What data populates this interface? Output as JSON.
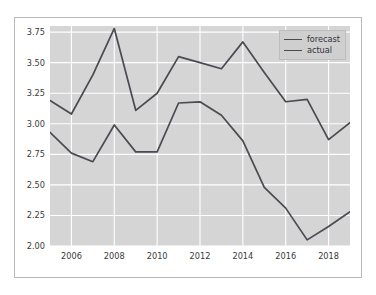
{
  "chart_data": {
    "type": "line",
    "title": "",
    "xlabel": "",
    "ylabel": "",
    "x": [
      2005,
      2006,
      2007,
      2008,
      2009,
      2010,
      2011,
      2012,
      2013,
      2014,
      2015,
      2016,
      2017,
      2018,
      2019
    ],
    "xlim": [
      2005,
      2019
    ],
    "ylim": [
      2.0,
      3.8
    ],
    "grid": true,
    "legend_position": "upper right",
    "xticks": [
      2006,
      2008,
      2010,
      2012,
      2014,
      2016,
      2018
    ],
    "xtick_labels": [
      "2006",
      "2008",
      "2010",
      "2012",
      "2014",
      "2016",
      "2018"
    ],
    "yticks": [
      2.0,
      2.25,
      2.5,
      2.75,
      3.0,
      3.25,
      3.5,
      3.75
    ],
    "ytick_labels": [
      "2.00",
      "2.25",
      "2.50",
      "2.75",
      "3.00",
      "3.25",
      "3.50",
      "3.75"
    ],
    "series": [
      {
        "name": "forecast",
        "color": "#4a4a52",
        "values": [
          3.19,
          3.08,
          3.4,
          3.78,
          3.11,
          3.25,
          3.55,
          3.5,
          3.45,
          3.67,
          3.42,
          3.18,
          3.2,
          2.87,
          3.01
        ]
      },
      {
        "name": "actual",
        "color": "#4a4a52",
        "values": [
          2.93,
          2.76,
          2.69,
          2.99,
          2.77,
          2.77,
          3.17,
          3.18,
          3.07,
          2.86,
          2.48,
          2.31,
          2.05,
          2.16,
          2.28
        ]
      }
    ],
    "plot_background": "#d5d5d5",
    "grid_color": "#ffffff",
    "figure_background": "#ffffff",
    "figure_border_color": "#b9b9b9"
  },
  "legend": {
    "items": [
      {
        "label": "forecast"
      },
      {
        "label": "actual"
      }
    ]
  }
}
